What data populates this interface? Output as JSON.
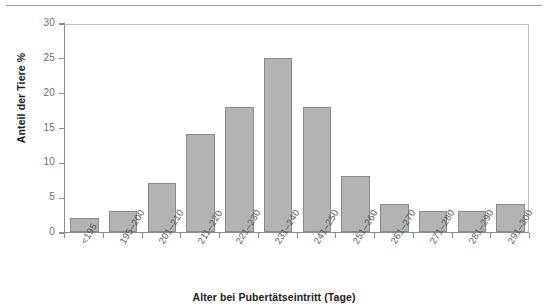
{
  "chart_data": {
    "type": "bar",
    "title": "",
    "xlabel": "Alter bei Pubertätseintritt (Tage)",
    "ylabel": "Anteil der Tiere %",
    "categories": [
      "<195",
      "195–200",
      "201–210",
      "211–220",
      "221–230",
      "231–240",
      "241–250",
      "251–260",
      "261–270",
      "271–280",
      "281–290",
      "291–300"
    ],
    "values": [
      2,
      3,
      7,
      14,
      18,
      25,
      18,
      8,
      4,
      3,
      3,
      4
    ],
    "ylim": [
      0,
      30
    ],
    "yticks": [
      0,
      5,
      10,
      15,
      20,
      25,
      30
    ],
    "ytick_labels": [
      "0",
      "5",
      "10",
      "15",
      "20",
      "25",
      "30"
    ],
    "grid": false,
    "legend": null,
    "bar_color": "#b3b3b3",
    "bar_border_color": "#8a8a8a",
    "axis_color": "#8d8d8d",
    "tick_label_color": "#6e6e6e",
    "axis_title_color": "#1b1b1b"
  }
}
